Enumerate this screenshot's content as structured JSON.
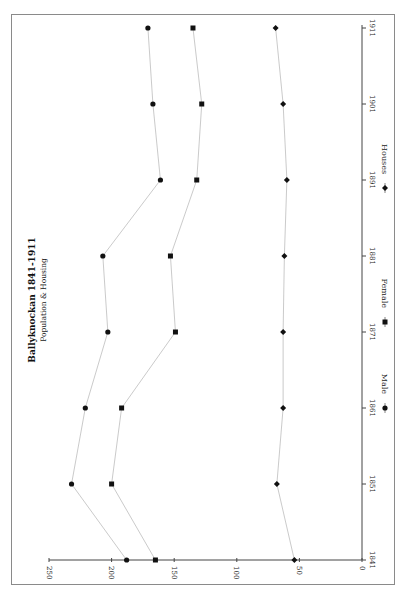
{
  "chart_data": {
    "type": "line",
    "title": "Ballyknockan 1841-1911",
    "subtitle": "Population & Housing",
    "xlabel": "",
    "ylabel": "",
    "orientation": "rotated 90° (value axis horizontal, years vertical)",
    "categories": [
      "1841",
      "1851",
      "1861",
      "1871",
      "1881",
      "1891",
      "1901",
      "1911"
    ],
    "series": [
      {
        "name": "Male",
        "marker": "circle",
        "values": [
          188,
          232,
          221,
          203,
          207,
          161,
          167,
          171
        ]
      },
      {
        "name": "Female",
        "marker": "square",
        "values": [
          165,
          200,
          192,
          149,
          153,
          132,
          128,
          135
        ]
      },
      {
        "name": "Houses",
        "marker": "diamond",
        "values": [
          54,
          68,
          63,
          63,
          62,
          60,
          63,
          69
        ]
      }
    ],
    "ylim": [
      0,
      250
    ],
    "yticks": [
      "0",
      "50",
      "100",
      "150",
      "200",
      "250"
    ],
    "grid": false,
    "legend_position": "right"
  },
  "colors": {
    "line": "#bdbdbd",
    "marker": "#111111",
    "axis": "#444444",
    "frame": "#8a8a8a"
  }
}
